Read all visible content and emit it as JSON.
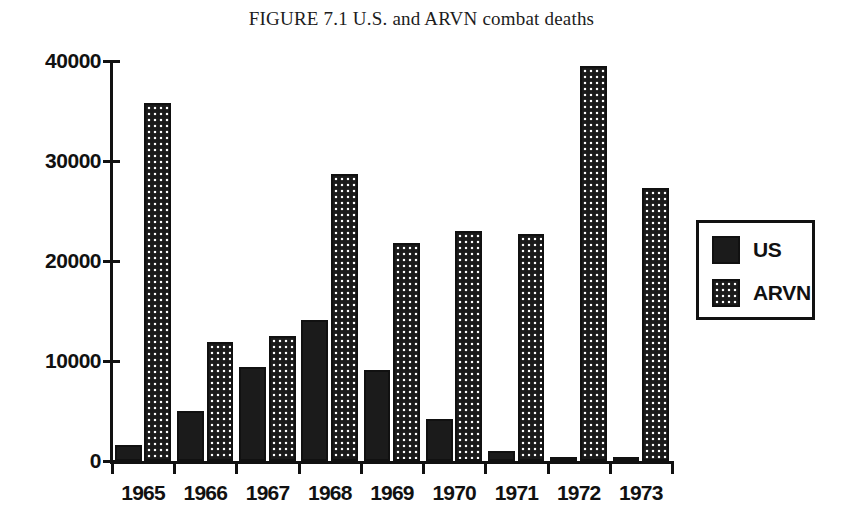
{
  "chart_data": {
    "type": "bar",
    "title": "FIGURE 7.1 U.S. and ARVN combat deaths",
    "xlabel": "",
    "ylabel": "",
    "categories": [
      "1965",
      "1966",
      "1967",
      "1968",
      "1969",
      "1970",
      "1971",
      "1972",
      "1973"
    ],
    "series": [
      {
        "name": "US",
        "color": "#1b1b1b",
        "pattern": "solid",
        "values": [
          1600,
          5000,
          9400,
          14100,
          9100,
          4200,
          1000,
          300,
          100
        ]
      },
      {
        "name": "ARVN",
        "color": "#1b1b1b",
        "pattern": "dotted",
        "values": [
          35800,
          11900,
          12500,
          28700,
          21800,
          23000,
          22700,
          39500,
          27300
        ]
      }
    ],
    "ylim": [
      0,
      40000
    ],
    "yticks": [
      0,
      10000,
      20000,
      30000,
      40000
    ],
    "ytick_labels": [
      "0",
      "10000",
      "20000",
      "30000",
      "40000"
    ],
    "grid": false,
    "legend": {
      "position": "right",
      "entries": [
        {
          "label": "US",
          "pattern": "solid"
        },
        {
          "label": "ARVN",
          "pattern": "dotted"
        }
      ]
    }
  }
}
